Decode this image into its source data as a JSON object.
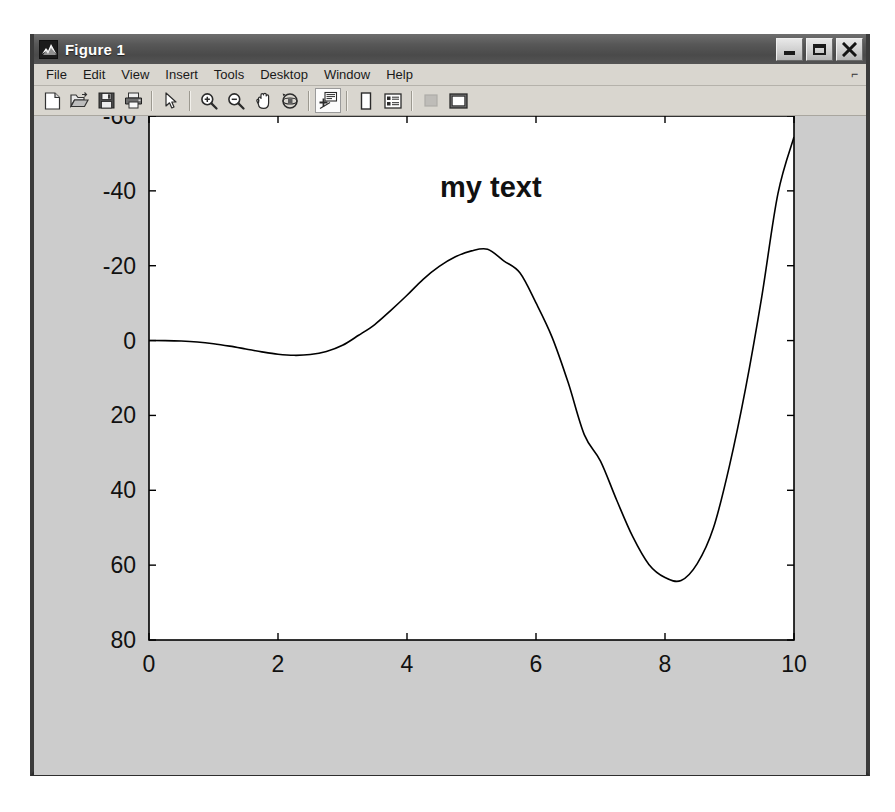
{
  "window": {
    "title": "Figure 1",
    "icon": "matlab-membrane-icon",
    "controls": [
      {
        "name": "minimize",
        "glyph": "_"
      },
      {
        "name": "maximize",
        "glyph": "□"
      },
      {
        "name": "close",
        "glyph": "✕"
      }
    ]
  },
  "menubar": {
    "items": [
      {
        "label": "File"
      },
      {
        "label": "Edit"
      },
      {
        "label": "View"
      },
      {
        "label": "Insert"
      },
      {
        "label": "Tools"
      },
      {
        "label": "Desktop"
      },
      {
        "label": "Window"
      },
      {
        "label": "Help"
      }
    ],
    "corner_marker": "⌐"
  },
  "toolbar": {
    "buttons": [
      {
        "name": "new-figure-icon",
        "title": "New Figure",
        "state": "normal"
      },
      {
        "name": "open-file-icon",
        "title": "Open File",
        "state": "normal"
      },
      {
        "name": "save-figure-icon",
        "title": "Save Figure",
        "state": "normal"
      },
      {
        "name": "print-figure-icon",
        "title": "Print Figure",
        "state": "normal"
      },
      {
        "name": "separator-1",
        "title": "",
        "state": "separator"
      },
      {
        "name": "edit-plot-pointer-icon",
        "title": "Edit Plot",
        "state": "normal"
      },
      {
        "name": "separator-2",
        "title": "",
        "state": "separator"
      },
      {
        "name": "zoom-in-icon",
        "title": "Zoom In",
        "state": "normal"
      },
      {
        "name": "zoom-out-icon",
        "title": "Zoom Out",
        "state": "normal"
      },
      {
        "name": "pan-hand-icon",
        "title": "Pan",
        "state": "normal"
      },
      {
        "name": "rotate-3d-icon",
        "title": "Rotate 3D",
        "state": "normal"
      },
      {
        "name": "separator-3",
        "title": "",
        "state": "separator"
      },
      {
        "name": "data-cursor-icon",
        "title": "Data Cursor",
        "state": "active"
      },
      {
        "name": "separator-4",
        "title": "",
        "state": "separator"
      },
      {
        "name": "insert-colorbar-icon",
        "title": "Insert Colorbar",
        "state": "normal"
      },
      {
        "name": "insert-legend-icon",
        "title": "Insert Legend",
        "state": "normal"
      },
      {
        "name": "separator-5",
        "title": "",
        "state": "separator"
      },
      {
        "name": "hide-plot-tools-icon",
        "title": "Hide Plot Tools",
        "state": "disabled"
      },
      {
        "name": "show-plot-tools-icon",
        "title": "Show Plot Tools",
        "state": "normal"
      }
    ]
  },
  "chart_data": {
    "type": "line",
    "title": "",
    "xlabel": "",
    "ylabel": "",
    "xlim": [
      0,
      10
    ],
    "ylim": [
      -60,
      80
    ],
    "y_axis_direction": "reverse",
    "xticks": [
      0,
      2,
      4,
      6,
      8,
      10
    ],
    "yticks": [
      -60,
      -40,
      -20,
      0,
      20,
      40,
      60,
      80
    ],
    "grid": false,
    "legend": null,
    "line_color": "#000000",
    "background_color": "#ffffff",
    "figure_color": "#cccccc",
    "annotations": [
      {
        "text": "my text",
        "x": 5.3,
        "y": -40,
        "bold": true,
        "fontsize": 29
      }
    ],
    "series": [
      {
        "name": "x^2 sin(x)",
        "x": [
          0,
          0.25,
          0.5,
          0.75,
          1,
          1.25,
          1.5,
          1.75,
          2,
          2.25,
          2.5,
          2.75,
          3,
          3.25,
          3.5,
          3.75,
          4,
          4.25,
          4.5,
          4.75,
          5,
          5.25,
          5.5,
          5.75,
          6,
          6.25,
          6.5,
          6.75,
          7,
          7.25,
          7.5,
          7.75,
          8,
          8.25,
          8.5,
          8.75,
          9,
          9.25,
          9.5,
          9.75,
          10
        ],
        "y": [
          0,
          0.015,
          0.12,
          0.38,
          0.84,
          1.48,
          2.24,
          3.01,
          3.64,
          3.94,
          3.74,
          2.93,
          1.27,
          -1.41,
          -4.29,
          -8.07,
          -12.1,
          -16.37,
          -19.8,
          -22.37,
          -23.97,
          -24.38,
          -21.3,
          -18.1,
          -10.05,
          -0.86,
          11.3,
          25.2,
          32.2,
          42.6,
          52.4,
          59.8,
          63.3,
          64.1,
          59.6,
          50.1,
          33.4,
          12.7,
          -11.7,
          -39.2,
          -54.4
        ]
      }
    ]
  },
  "caption": ""
}
